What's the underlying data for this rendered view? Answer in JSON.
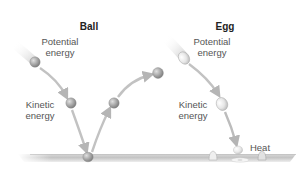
{
  "diagram": {
    "ball_panel": {
      "title": "Ball",
      "potential_label": {
        "line1": "Potential",
        "line2": "energy"
      },
      "kinetic_label": {
        "line1": "Kinetic",
        "line2": "energy"
      }
    },
    "egg_panel": {
      "title": "Egg",
      "potential_label": {
        "line1": "Potential",
        "line2": "energy"
      },
      "kinetic_label": {
        "line1": "Kinetic",
        "line2": "energy"
      },
      "heat_label": "Heat"
    },
    "colors": {
      "ball": "#9a9a9a",
      "ball_highlight": "#d6d6d6",
      "egg": "#e4e4e4",
      "arrow": "#bdbdbd",
      "ground": "#c8c8c8",
      "text": "#555555",
      "title": "#222222"
    }
  }
}
